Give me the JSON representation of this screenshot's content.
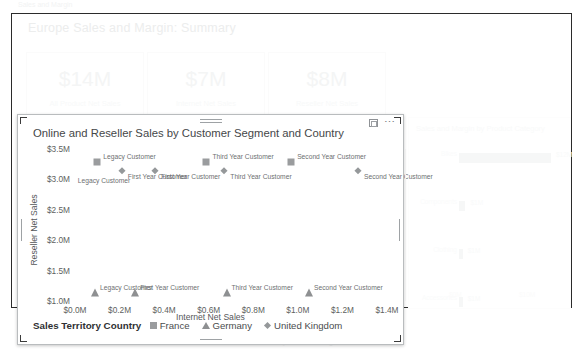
{
  "report": {
    "title": "Europe Sales and Margin: Summary",
    "top_strip": "Sales and Margin",
    "footer_strip": "Online and Reseller Sales by Customer Segment",
    "kpis": [
      {
        "value": "$14M",
        "label": "All Product Net Sales"
      },
      {
        "value": "$7M",
        "label": "Internet Net Sales"
      },
      {
        "value": "$8M",
        "label": "Reseller Net Sales"
      }
    ],
    "ghost_visual": {
      "title": "Sales and Margin by Product Category",
      "rows": [
        {
          "category": "Bikes",
          "value": "$12M",
          "bar_pct": 100
        },
        {
          "category": "Components",
          "value": "$1M",
          "bar_pct": 7
        },
        {
          "category": "Clothing",
          "value": "$1M",
          "bar_pct": 4
        },
        {
          "category": "Accessories",
          "value": "$1M",
          "bar_pct": 4
        }
      ],
      "axis_labels": [
        "$0M",
        "$10M"
      ]
    }
  },
  "chart_window": {
    "focus_icon": "focus-mode-icon",
    "more_icon": "⋯"
  },
  "chart_data": {
    "type": "scatter",
    "title": "Online and Reseller Sales by Customer Segment and Country",
    "xlabel": "Internet Net Sales",
    "ylabel": "Reseller Net Sales",
    "xlim": [
      0.0,
      1.4
    ],
    "ylim": [
      1.0,
      3.5
    ],
    "xticks": [
      "$0.0M",
      "$0.2M",
      "$0.4M",
      "$0.6M",
      "$0.8M",
      "$1.0M",
      "$1.2M",
      "$1.4M"
    ],
    "xtick_values": [
      0.0,
      0.2,
      0.4,
      0.6,
      0.8,
      1.0,
      1.2,
      1.4
    ],
    "yticks": [
      "$3.5M",
      "$3.0M",
      "$2.5M",
      "$2.0M",
      "$1.5M",
      "$1.0M"
    ],
    "ytick_values": [
      3.5,
      3.0,
      2.5,
      2.0,
      1.5,
      1.0
    ],
    "grid": false,
    "legend_position": "bottom-left",
    "legend_title": "Sales Territory Country",
    "series": [
      {
        "name": "France",
        "marker": "square",
        "color": "#9a9c9e",
        "points": [
          {
            "label": "Legacy Customer",
            "x": 0.1,
            "y": 3.28
          },
          {
            "label": "Third Year Customer",
            "x": 0.59,
            "y": 3.28
          },
          {
            "label": "Second Year Customer",
            "x": 0.97,
            "y": 3.28
          }
        ]
      },
      {
        "name": "Germany",
        "marker": "triangle",
        "color": "#8e9092",
        "points": [
          {
            "label": "Legacy Customer",
            "x": 0.09,
            "y": 1.13
          },
          {
            "label": "First Year Customer",
            "x": 0.27,
            "y": 1.13
          },
          {
            "label": "Third Year Customer",
            "x": 0.68,
            "y": 1.13
          },
          {
            "label": "Second Year Customer",
            "x": 1.05,
            "y": 1.13
          }
        ]
      },
      {
        "name": "United Kingdom",
        "marker": "diamond",
        "color": "#95989a",
        "points": [
          {
            "label": "First Year Customer",
            "x": 0.21,
            "y": 3.13
          },
          {
            "label": "First Year Customer",
            "x": 0.36,
            "y": 3.13
          },
          {
            "label": "Third Year Customer",
            "x": 0.67,
            "y": 3.13
          },
          {
            "label": "Second Year Customer",
            "x": 1.27,
            "y": 3.13
          }
        ]
      }
    ],
    "extra_labels": [
      {
        "text": "Legacy Customer",
        "x": 0.13,
        "y": 2.97
      }
    ]
  }
}
